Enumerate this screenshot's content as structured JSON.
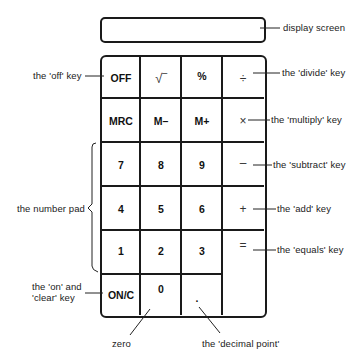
{
  "title_partial": "",
  "display": {
    "label": "display screen"
  },
  "keys": {
    "off": "OFF",
    "sqrt": "√‾",
    "percent": "%",
    "divide": "÷",
    "mrc": "MRC",
    "m_minus": "M–",
    "m_plus": "M+",
    "multiply": "×",
    "seven": "7",
    "eight": "8",
    "nine": "9",
    "subtract": "–",
    "four": "4",
    "five": "5",
    "six": "6",
    "add": "+",
    "one": "1",
    "two": "2",
    "three": "3",
    "equals": "=",
    "on_clear": "ON/C",
    "zero": "0",
    "decimal": "."
  },
  "labels": {
    "off_key": "the 'off' key",
    "divide_key": "the 'divide' key",
    "multiply_key": "the 'multiply' key",
    "subtract_key": "the 'subtract' key",
    "add_key": "the 'add' key",
    "equals_key": "the 'equals' key",
    "number_pad": "the number pad",
    "on_clear_key": "the 'on' and\n'clear' key",
    "zero": "zero",
    "decimal_point": "the 'decimal point'",
    "display_screen": "display screen"
  }
}
